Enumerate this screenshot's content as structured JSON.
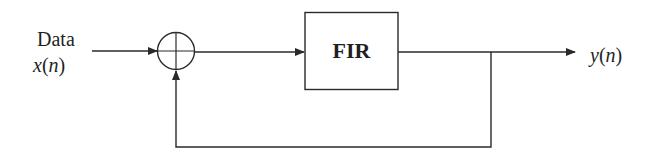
{
  "diagram": {
    "type": "block-diagram",
    "title": "",
    "input": {
      "label_line1": "Data",
      "label_var": "x",
      "label_open": "(",
      "label_arg": "n",
      "label_close": ")"
    },
    "summing_junction": {
      "symbol": "plus-circle"
    },
    "block": {
      "label": "FIR"
    },
    "output": {
      "label_var": "y",
      "label_open": "(",
      "label_arg": "n",
      "label_close": ")"
    },
    "connections": [
      {
        "from": "input",
        "to": "summing_junction"
      },
      {
        "from": "summing_junction",
        "to": "block"
      },
      {
        "from": "block",
        "to": "output"
      },
      {
        "from": "output",
        "to": "summing_junction",
        "kind": "feedback"
      }
    ],
    "colors": {
      "stroke": "#2a2a2a",
      "text": "#1f1f1f",
      "background": "#ffffff"
    }
  }
}
